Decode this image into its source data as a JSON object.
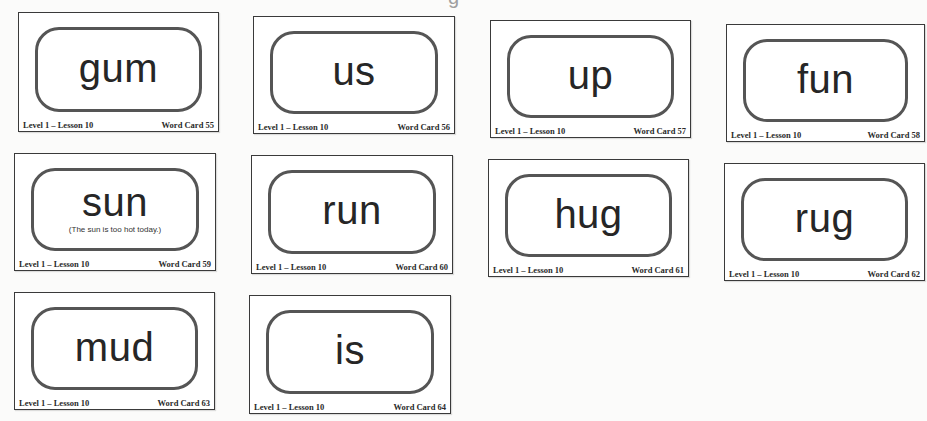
{
  "page": {
    "title_fragment": "g"
  },
  "cards": [
    {
      "word": "gum",
      "sentence": "",
      "level": "Level 1 – Lesson 10",
      "card_label": "Word Card 55"
    },
    {
      "word": "us",
      "sentence": "",
      "level": "Level 1 – Lesson 10",
      "card_label": "Word Card 56"
    },
    {
      "word": "up",
      "sentence": "",
      "level": "Level 1 – Lesson 10",
      "card_label": "Word Card 57"
    },
    {
      "word": "fun",
      "sentence": "",
      "level": "Level 1 – Lesson 10",
      "card_label": "Word Card 58"
    },
    {
      "word": "sun",
      "sentence": "(The sun is too hot today.)",
      "level": "Level 1 – Lesson 10",
      "card_label": "Word Card 59"
    },
    {
      "word": "run",
      "sentence": "",
      "level": "Level 1 – Lesson 10",
      "card_label": "Word Card 60"
    },
    {
      "word": "hug",
      "sentence": "",
      "level": "Level 1 – Lesson 10",
      "card_label": "Word Card 61"
    },
    {
      "word": "rug",
      "sentence": "",
      "level": "Level 1 – Lesson 10",
      "card_label": "Word Card 62"
    },
    {
      "word": "mud",
      "sentence": "",
      "level": "Level 1 – Lesson 10",
      "card_label": "Word Card 63"
    },
    {
      "word": "is",
      "sentence": "",
      "level": "Level 1 – Lesson 10",
      "card_label": "Word Card 64"
    }
  ]
}
